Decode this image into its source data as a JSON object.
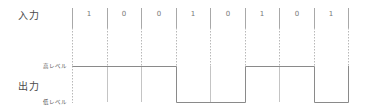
{
  "labels": {
    "input": "入力",
    "output": "出力",
    "high_level": "高レベル",
    "low_level": "低レベル"
  },
  "input_bits": [
    "1",
    "0",
    "0",
    "1",
    "0",
    "1",
    "0",
    "1"
  ],
  "output_levels": [
    "high",
    "high",
    "high",
    "low",
    "low",
    "high",
    "high",
    "low"
  ],
  "colors": {
    "line": "#9a9a9a",
    "text": "#4a4a4a"
  }
}
